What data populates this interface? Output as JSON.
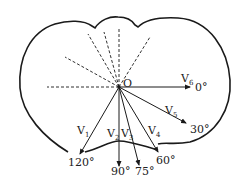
{
  "diagram": {
    "origin_label": "O",
    "stroke_color": "#1a1a1a",
    "vectors": [
      {
        "name": "V",
        "sub": "1",
        "angle_label": "120°"
      },
      {
        "name": "V",
        "sub": "2",
        "angle_label": "90°"
      },
      {
        "name": "V",
        "sub": "3",
        "angle_label": "75°"
      },
      {
        "name": "V",
        "sub": "4",
        "angle_label": "60°"
      },
      {
        "name": "V",
        "sub": "5",
        "angle_label": "30°"
      },
      {
        "name": "V",
        "sub": "6",
        "angle_label": "0°"
      }
    ],
    "dashed_lines_count": 6
  }
}
